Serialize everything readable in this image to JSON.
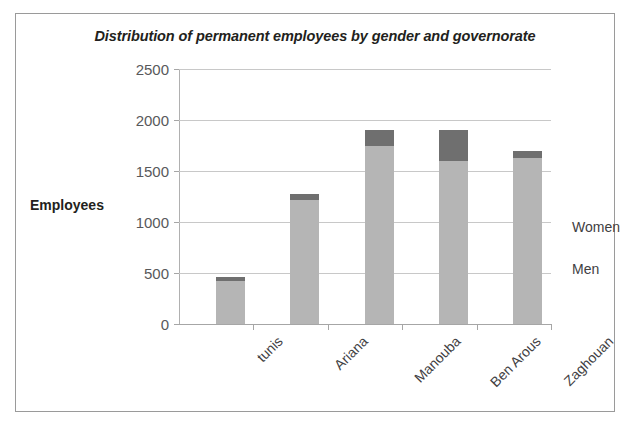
{
  "chart_data": {
    "type": "bar",
    "subtype": "stacked-bar",
    "title": "Distribution of permanent employees by gender and governorate",
    "xlabel": "",
    "ylabel": "Employees",
    "categories": [
      "tunis",
      "Ariana",
      "Manouba",
      "Ben Arous",
      "Zaghouan"
    ],
    "series": [
      {
        "name": "Men",
        "values": [
          420,
          1220,
          1750,
          1600,
          1630
        ],
        "color": "#b5b5b5"
      },
      {
        "name": "Women",
        "values": [
          40,
          55,
          150,
          300,
          70
        ],
        "color": "#6f6f6f"
      }
    ],
    "totals": [
      460,
      1275,
      1900,
      1900,
      1700
    ],
    "ylim": [
      0,
      2500
    ],
    "yticks": [
      0,
      500,
      1000,
      1500,
      2000,
      2500
    ],
    "ytick_labels": [
      "0",
      "500",
      "1000",
      "1500",
      "2000",
      "2500"
    ],
    "grid": true,
    "legend_position": "right",
    "legend_entries": [
      "Women",
      "Men"
    ],
    "stack_order_bottom_to_top": [
      "Men",
      "Women"
    ]
  },
  "colors": {
    "men": "#b5b5b5",
    "women": "#6f6f6f",
    "gridline": "#c8c8c8",
    "axis": "#a6a6a6",
    "frame": "#9a9a9a",
    "title_text": "#231f20",
    "tick_text": "#58595b",
    "label_text": "#414042",
    "background": "#ffffff"
  }
}
